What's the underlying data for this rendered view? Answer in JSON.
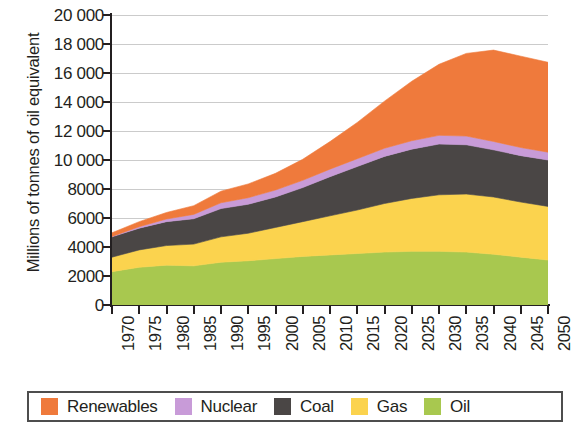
{
  "chart_data": {
    "type": "area",
    "stacked": true,
    "title": "",
    "subtitle": "",
    "xlabel": "",
    "ylabel": "Millions of tonnes of oil equivalent",
    "xlim": [
      1970,
      2050
    ],
    "ylim": [
      0,
      20000
    ],
    "ytick_step": 2000,
    "grid": true,
    "legend_position": "bottom",
    "x": [
      1970,
      1975,
      1980,
      1985,
      1990,
      1995,
      2000,
      2005,
      2010,
      2015,
      2020,
      2025,
      2030,
      2035,
      2040,
      2045,
      2050
    ],
    "xtick_labels": [
      "1970",
      "1975",
      "1980",
      "1985",
      "1990",
      "1995",
      "2000",
      "2005",
      "2010",
      "2015",
      "2020",
      "2025",
      "2030",
      "2035",
      "2040",
      "2045",
      "2050"
    ],
    "ytick_labels": [
      "0",
      "2000",
      "4000",
      "6000",
      "8000",
      "10 000",
      "12 000",
      "14 000",
      "16 000",
      "18 000",
      "20 000"
    ],
    "ytick_values": [
      0,
      2000,
      4000,
      6000,
      8000,
      10000,
      12000,
      14000,
      16000,
      18000,
      20000
    ],
    "stack_order_bottom_to_top": [
      "Oil",
      "Gas",
      "Coal",
      "Nuclear",
      "Renewables"
    ],
    "series": [
      {
        "name": "Oil",
        "color": "#a8c84f",
        "values": [
          2300,
          2600,
          2750,
          2700,
          2950,
          3050,
          3200,
          3350,
          3450,
          3550,
          3650,
          3700,
          3700,
          3650,
          3500,
          3300,
          3100
        ]
      },
      {
        "name": "Gas",
        "color": "#fbd34e",
        "values": [
          1000,
          1200,
          1350,
          1500,
          1750,
          1900,
          2150,
          2400,
          2700,
          3000,
          3350,
          3650,
          3900,
          4000,
          3950,
          3800,
          3700
        ]
      },
      {
        "name": "Coal",
        "color": "#4a4645",
        "values": [
          1400,
          1500,
          1650,
          1750,
          1950,
          2000,
          2100,
          2350,
          2700,
          3000,
          3250,
          3400,
          3500,
          3400,
          3250,
          3200,
          3200
        ]
      },
      {
        "name": "Nuclear",
        "color": "#c89bd8",
        "values": [
          30,
          100,
          180,
          300,
          400,
          450,
          480,
          500,
          520,
          540,
          560,
          580,
          600,
          600,
          580,
          560,
          540
        ]
      },
      {
        "name": "Renewables",
        "color": "#ef7a3c",
        "values": [
          250,
          350,
          450,
          600,
          800,
          950,
          1150,
          1450,
          1900,
          2500,
          3250,
          4100,
          4900,
          5700,
          6300,
          6300,
          6200
        ]
      }
    ],
    "totals": [
      4980,
      5750,
      6380,
      6850,
      7850,
      8350,
      9080,
      10050,
      11270,
      12590,
      14060,
      15430,
      16600,
      17350,
      17580,
      17160,
      16740
    ]
  },
  "legend": {
    "items": [
      {
        "label": "Renewables",
        "color": "#ef7a3c"
      },
      {
        "label": "Nuclear",
        "color": "#c89bd8"
      },
      {
        "label": "Coal",
        "color": "#4a4645"
      },
      {
        "label": "Gas",
        "color": "#fbd34e"
      },
      {
        "label": "Oil",
        "color": "#a8c84f"
      }
    ]
  },
  "axes": {
    "y_title": "Millions of tonnes of oil equivalent"
  }
}
